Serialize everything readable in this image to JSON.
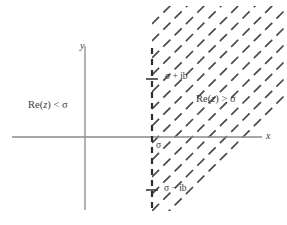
{
  "figure": {
    "type": "complex-plane-diagram",
    "background_color": "#ffffff",
    "axis_color": "#8a8a8a",
    "hatch_color": "#4a4a4a",
    "dashed_line_color": "#2e2e2e",
    "text_color": "#3d3d3d"
  },
  "axes": {
    "x_label": "x",
    "y_label": "y",
    "origin": {
      "x": 85,
      "y": 137
    },
    "x_start": 12,
    "x_end": 262,
    "y_start": 46,
    "y_end": 210
  },
  "vertical_line": {
    "label_at_axis": "σ",
    "x_position": 152,
    "y_top": 48,
    "y_bottom": 208,
    "style": "dashed",
    "tick_top": {
      "label": "σ + ib",
      "y": 79
    },
    "tick_bottom": {
      "label": "σ − ib",
      "y": 190
    }
  },
  "regions": {
    "left": {
      "label": "Re(z) < σ",
      "label_prefix": "Re(",
      "label_var": "z",
      "label_suffix": ") < σ",
      "x": 28,
      "y": 100
    },
    "right": {
      "label": "Re(z) > σ",
      "label_prefix": "Re(",
      "label_var": "z",
      "label_suffix": ") > σ",
      "x": 196,
      "y": 94,
      "shading": "diagonal-dashed-hatching"
    }
  },
  "hatching": {
    "angle_degrees": 45,
    "direction": "up-right",
    "dash_length": 10,
    "gap_length": 6,
    "line_count": 13,
    "spacing": 17
  }
}
